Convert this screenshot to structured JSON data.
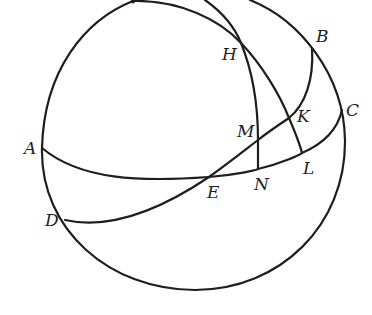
{
  "figure": {
    "type": "spherical-geometry-diagram",
    "stroke_color": "#1e1e1e",
    "background_color": "#ffffff"
  },
  "points": [
    {
      "id": "A",
      "label": "A",
      "x": 42,
      "y": 148,
      "label_x": 24,
      "label_y": 154
    },
    {
      "id": "B",
      "label": "B",
      "x": 312,
      "y": 48,
      "label_x": 316,
      "label_y": 42
    },
    {
      "id": "C",
      "label": "C",
      "x": 342,
      "y": 110,
      "label_x": 346,
      "label_y": 116
    },
    {
      "id": "D",
      "label": "D",
      "x": 65,
      "y": 220,
      "label_x": 45,
      "label_y": 226
    },
    {
      "id": "E",
      "label": "E",
      "x": 209,
      "y": 177,
      "label_x": 207,
      "label_y": 198
    },
    {
      "id": "H",
      "label": "H",
      "x": 241,
      "y": 43,
      "label_x": 222,
      "label_y": 60
    },
    {
      "id": "K",
      "label": "K",
      "x": 289,
      "y": 118,
      "label_x": 297,
      "label_y": 122
    },
    {
      "id": "L",
      "label": "L",
      "x": 302,
      "y": 152,
      "label_x": 303,
      "label_y": 174
    },
    {
      "id": "M",
      "label": "M",
      "x": 258,
      "y": 140,
      "label_x": 237,
      "label_y": 137
    },
    {
      "id": "N",
      "label": "N",
      "x": 258,
      "y": 168,
      "label_x": 254,
      "label_y": 190
    }
  ],
  "curves": [
    {
      "id": "outer-circle",
      "description": "Sphere outline"
    },
    {
      "id": "arc-AENLC",
      "description": "Great circle through A, E, N, L, C"
    },
    {
      "id": "arc-DEMKB",
      "description": "Great circle through D, E, M, K, B"
    },
    {
      "id": "arc-HKL",
      "description": "Arc from top through H, K to L"
    },
    {
      "id": "arc-HMN",
      "description": "Arc from top through H, M to N"
    }
  ]
}
